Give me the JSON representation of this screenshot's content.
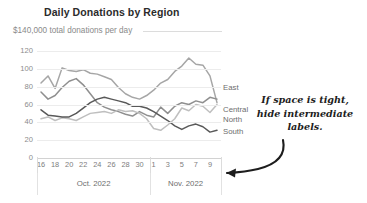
{
  "chart_data": {
    "type": "line",
    "title": "Daily Donations by Region",
    "subtitle": "$140,000 total donations per day",
    "xlabel": "",
    "ylabel": "",
    "ylim": [
      0,
      130
    ],
    "yticks": [
      0,
      20,
      40,
      60,
      80,
      100,
      120
    ],
    "ytick_labels": [
      "0",
      "20",
      "40",
      "60",
      "80",
      "100",
      "120"
    ],
    "grid": true,
    "legend_position": "right-end-labels",
    "x": [
      15,
      16,
      17,
      18,
      19,
      20,
      21,
      22,
      23,
      24,
      25,
      26,
      27,
      28,
      29,
      30,
      31,
      1,
      2,
      3,
      4,
      5,
      6,
      7,
      8,
      9
    ],
    "xtick_labels": [
      "16",
      "18",
      "20",
      "22",
      "24",
      "26",
      "28",
      "30",
      "1",
      "3",
      "5",
      "7",
      "9"
    ],
    "xtick_values": [
      16,
      18,
      20,
      22,
      24,
      26,
      28,
      30,
      1,
      3,
      5,
      7,
      9
    ],
    "group_labels": [
      "Oct. 2022",
      "Nov. 2022"
    ],
    "series": [
      {
        "name": "East",
        "color": "#a6a6a6",
        "values": [
          84,
          92,
          78,
          101,
          98,
          97,
          99,
          95,
          94,
          91,
          88,
          79,
          72,
          68,
          66,
          70,
          76,
          84,
          88,
          97,
          103,
          112,
          105,
          104,
          92,
          62
        ]
      },
      {
        "name": "Central",
        "color": "#8f8f8f",
        "values": [
          74,
          66,
          70,
          79,
          86,
          89,
          82,
          72,
          62,
          57,
          54,
          52,
          49,
          47,
          52,
          48,
          46,
          57,
          50,
          58,
          62,
          60,
          64,
          62,
          68,
          66
        ]
      },
      {
        "name": "North",
        "color": "#bfbfbf",
        "values": [
          44,
          46,
          42,
          45,
          44,
          42,
          46,
          50,
          51,
          52,
          50,
          54,
          52,
          53,
          50,
          44,
          33,
          31,
          37,
          44,
          56,
          53,
          60,
          58,
          51,
          60
        ]
      },
      {
        "name": "South",
        "color": "#595959",
        "values": [
          54,
          48,
          47,
          46,
          46,
          50,
          56,
          62,
          66,
          68,
          66,
          64,
          62,
          58,
          58,
          56,
          52,
          47,
          42,
          36,
          32,
          36,
          38,
          35,
          29,
          31
        ]
      }
    ]
  },
  "annotation": {
    "line1": "If space is tight,",
    "line2": "hide intermediate",
    "line3": "labels.",
    "arrow_name": "annotation-arrow"
  }
}
